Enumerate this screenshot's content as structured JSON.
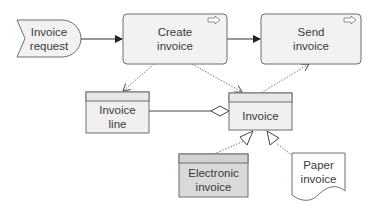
{
  "diagram": {
    "colors": {
      "stroke": "#6e6e6e",
      "box_fill": "#f2f2f2",
      "class_fill": "#f0f0f0",
      "class_header_fill": "#e6e6e6",
      "electronic_fill": "#d9d9d9",
      "text": "#3a3a3a"
    },
    "nodes": {
      "invoice_request": {
        "label": "Invoice\nrequest",
        "shape": "event"
      },
      "create_invoice": {
        "label": "Create\ninvoice",
        "shape": "process",
        "icon": "arrow-right-icon"
      },
      "send_invoice": {
        "label": "Send\ninvoice",
        "shape": "process",
        "icon": "arrow-right-icon"
      },
      "invoice_line": {
        "label": "Invoice\nline",
        "shape": "class"
      },
      "invoice": {
        "label": "Invoice",
        "shape": "class"
      },
      "electronic_invoice": {
        "label": "Electronic\ninvoice",
        "shape": "class"
      },
      "paper_invoice": {
        "label": "Paper\ninvoice",
        "shape": "document"
      }
    },
    "edges": [
      {
        "from": "invoice_request",
        "to": "create_invoice",
        "type": "sequence-flow"
      },
      {
        "from": "create_invoice",
        "to": "send_invoice",
        "type": "sequence-flow"
      },
      {
        "from": "create_invoice",
        "to": "invoice_line",
        "type": "dotted-association"
      },
      {
        "from": "create_invoice",
        "to": "invoice",
        "type": "dotted-association"
      },
      {
        "from": "invoice",
        "to": "send_invoice",
        "type": "dotted-association"
      },
      {
        "from": "invoice_line",
        "to": "invoice",
        "type": "aggregation"
      },
      {
        "from": "electronic_invoice",
        "to": "invoice",
        "type": "generalization"
      },
      {
        "from": "paper_invoice",
        "to": "invoice",
        "type": "generalization"
      }
    ]
  }
}
